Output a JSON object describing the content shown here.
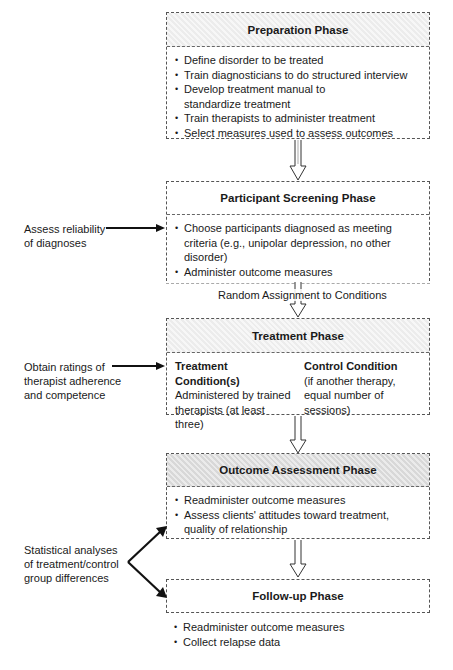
{
  "phases": [
    {
      "title": "Preparation Phase",
      "items": [
        "Define disorder to be treated",
        "Train diagnosticians to do structured interview",
        "Develop treatment manual to standardize treatment",
        "Train therapists to administer treatment",
        "Select measures used to assess outcomes"
      ]
    },
    {
      "title": "Participant Screening Phase",
      "items": [
        "Choose participants diagnosed as meeting criteria (e.g., unipolar depression, no other disorder)",
        "Administer outcome measures"
      ]
    },
    {
      "title": "Treatment Phase",
      "conditions": [
        {
          "title": "Treatment Condition(s)",
          "text": "Administered by trained therapists (at least three)"
        },
        {
          "title": "Control Condition",
          "text": "(if another therapy, equal number of sessions)"
        }
      ]
    },
    {
      "title": "Outcome Assessment Phase",
      "items": [
        "Readminister outcome measures",
        "Assess clients' attitudes toward treatment, quality of relationship"
      ]
    },
    {
      "title": "Follow-up Phase",
      "items": [
        "Readminister outcome measures",
        "Collect relapse data"
      ]
    }
  ],
  "connector_label": "Random Assignment to Conditions",
  "side_notes": [
    {
      "text": "Assess reliability of diagnoses",
      "target": "Participant Screening Phase"
    },
    {
      "text": "Obtain ratings of therapist adherence and competence",
      "target": "Treatment Phase"
    },
    {
      "text": "Statistical analyses of treatment/control group differences",
      "targets": [
        "Outcome Assessment Phase",
        "Follow-up Phase"
      ]
    }
  ]
}
